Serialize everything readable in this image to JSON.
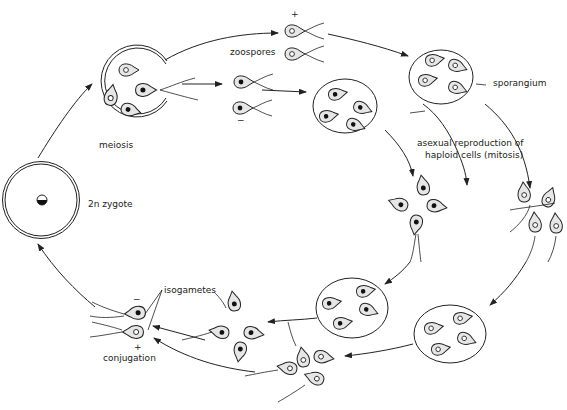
{
  "diagram": {
    "type": "life-cycle",
    "colors": {
      "line": "#222222",
      "cell_fill": "#e6e6e6",
      "background": "#ffffff"
    },
    "labels": {
      "zoospores": "zoospores",
      "meiosis": "meiosis",
      "sporangium": "sporangium",
      "asexual_line1": "asexual reproduction of",
      "asexual_line2": "haploid cells (mitosis)",
      "zygote": "2n zygote",
      "isogametes": "isogametes",
      "conjugation": "conjugation"
    },
    "signs": {
      "zoospore_plus": "+",
      "zoospore_minus": "−",
      "gamete_minus": "−",
      "gamete_plus": "+"
    },
    "stages": [
      "2n zygote",
      "meiosis",
      "zoospores (+ and −)",
      "sporangium",
      "asexual reproduction of haploid cells (mitosis)",
      "isogametes",
      "conjugation"
    ]
  }
}
